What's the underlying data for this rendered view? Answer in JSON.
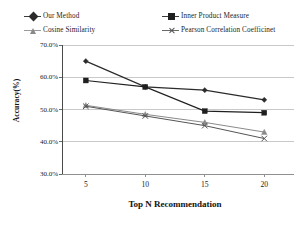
{
  "chart_data": {
    "type": "line",
    "title": "",
    "xlabel": "Top N Recommendation",
    "ylabel": "Accuracy(%)",
    "x": [
      5,
      10,
      15,
      20
    ],
    "categories": [
      "5",
      "10",
      "15",
      "20"
    ],
    "xtick_labels": [
      "5",
      "10",
      "15",
      "20"
    ],
    "ytick_labels": [
      "70.0%",
      "60.0%",
      "50.0%",
      "40.0%",
      "30.0%"
    ],
    "ytick_values": [
      70.0,
      60.0,
      50.0,
      40.0,
      30.0
    ],
    "ylim": [
      30.0,
      70.0
    ],
    "xlim": [
      3.0,
      22.5
    ],
    "grid": true,
    "legend_position": "top",
    "series": [
      {
        "name": "Our Method",
        "marker": "diamond",
        "color": "#2b2b2b",
        "values": [
          65.0,
          57.0,
          56.0,
          53.0
        ]
      },
      {
        "name": "Inner Product Measure",
        "marker": "square",
        "color": "#1f1f1f",
        "values": [
          59.0,
          57.0,
          49.5,
          49.0
        ]
      },
      {
        "name": "Cosine Similarity",
        "marker": "triangle",
        "color": "#8a8a8a",
        "values": [
          51.3,
          48.5,
          46.0,
          43.0
        ]
      },
      {
        "name": "Pearson Correlation Coefficinet",
        "marker": "x",
        "color": "#555555",
        "values": [
          51.0,
          48.0,
          45.0,
          41.0
        ]
      }
    ]
  },
  "legend": {
    "items": [
      {
        "label": "Our Method"
      },
      {
        "label": "Inner Product Measure"
      },
      {
        "label": "Cosine Similarity"
      },
      {
        "label": "Pearson Correlation Coefficinet"
      }
    ]
  },
  "axes": {
    "y_title": "Accuracy(%)",
    "x_title": "Top N Recommendation",
    "y_ticks": [
      "70.0%",
      "60.0%",
      "50.0%",
      "40.0%",
      "30.0%"
    ],
    "x_ticks": [
      "5",
      "10",
      "15",
      "20"
    ]
  }
}
